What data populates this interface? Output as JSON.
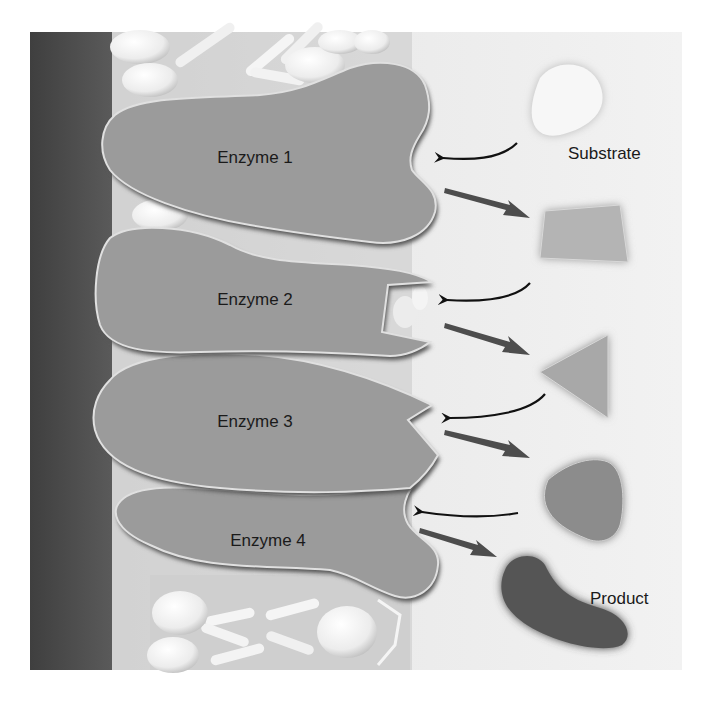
{
  "diagram": {
    "frame": {
      "x": 30,
      "y": 32,
      "width": 652,
      "height": 638
    },
    "colors": {
      "background_right": "#efefef",
      "membrane_dark": "#4a4a4a",
      "enzyme_fill": "#9a9a9a",
      "enzyme_rim": "#555555",
      "lipid_head": "#f4f4f4",
      "substrate": "#f6f6f6",
      "intermediate_1": "#b3b3b3",
      "intermediate_2": "#a6a6a6",
      "intermediate_3": "#8c8c8c",
      "product": "#555555",
      "binding_arrow": "#111111",
      "release_arrow": "#4d4d4d",
      "label_text": "#1a1a1a"
    },
    "enzymes": [
      {
        "label": "Enzyme 1",
        "active_site": "rounded notch"
      },
      {
        "label": "Enzyme 2",
        "active_site": "square notch"
      },
      {
        "label": "Enzyme 3",
        "active_site": "v-shaped notch"
      },
      {
        "label": "Enzyme 4",
        "active_site": "rounded notch"
      }
    ],
    "molecules": [
      {
        "role": "substrate",
        "shape": "oval",
        "label": "Substrate"
      },
      {
        "role": "intermediate",
        "shape": "trapezoid"
      },
      {
        "role": "intermediate",
        "shape": "triangle"
      },
      {
        "role": "intermediate",
        "shape": "rounded triangle"
      },
      {
        "role": "product",
        "shape": "kidney",
        "label": "Product"
      }
    ],
    "arrows": [
      {
        "type": "binding",
        "from": "substrate",
        "to": "Enzyme 1"
      },
      {
        "type": "release",
        "from": "Enzyme 1",
        "to": "trapezoid"
      },
      {
        "type": "binding",
        "from": "trapezoid",
        "to": "Enzyme 2"
      },
      {
        "type": "release",
        "from": "Enzyme 2",
        "to": "triangle"
      },
      {
        "type": "binding",
        "from": "triangle",
        "to": "Enzyme 3"
      },
      {
        "type": "release",
        "from": "Enzyme 3",
        "to": "rounded triangle"
      },
      {
        "type": "binding",
        "from": "rounded triangle",
        "to": "Enzyme 4"
      },
      {
        "type": "release",
        "from": "Enzyme 4",
        "to": "product"
      }
    ]
  },
  "labels": {
    "enzyme_1": "Enzyme 1",
    "enzyme_2": "Enzyme 2",
    "enzyme_3": "Enzyme 3",
    "enzyme_4": "Enzyme 4",
    "substrate": "Substrate",
    "product": "Product"
  }
}
